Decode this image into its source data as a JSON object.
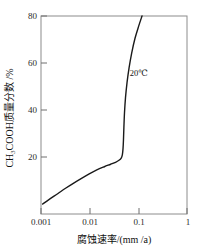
{
  "chart_data": {
    "type": "line",
    "title": "",
    "xlabel": "腐蚀速率/(mm /a)",
    "ylabel": "CH3COOH质量分数 /%",
    "ylabel_parts": {
      "prefix": "CH",
      "subscript": "3",
      "suffix": "COOH质量分数 /%"
    },
    "xscale": "log",
    "yscale": "linear",
    "xlim": [
      0.001,
      1
    ],
    "ylim": [
      0,
      80
    ],
    "xticks": [
      0.001,
      0.01,
      0.1,
      1
    ],
    "xticklabels": [
      "0.001",
      "0.01",
      "0.1",
      "1"
    ],
    "yticks": [
      20,
      40,
      60,
      80
    ],
    "yticklabels": [
      "20",
      "40",
      "60",
      "80"
    ],
    "grid": false,
    "legend": null,
    "annotations": [
      {
        "text": "20℃",
        "x": 0.055,
        "y": 57
      }
    ],
    "series": [
      {
        "name": "20℃",
        "color": "#1a1a1a",
        "points": [
          {
            "x": 0.00108,
            "y": 4.0
          },
          {
            "x": 0.0015,
            "y": 6.0
          },
          {
            "x": 0.0022,
            "y": 8.2
          },
          {
            "x": 0.0032,
            "y": 10.4
          },
          {
            "x": 0.0047,
            "y": 12.5
          },
          {
            "x": 0.0068,
            "y": 14.4
          },
          {
            "x": 0.0098,
            "y": 16.2
          },
          {
            "x": 0.014,
            "y": 17.8
          },
          {
            "x": 0.02,
            "y": 19.1
          },
          {
            "x": 0.027,
            "y": 20.1
          },
          {
            "x": 0.034,
            "y": 20.9
          },
          {
            "x": 0.04,
            "y": 21.7
          },
          {
            "x": 0.0445,
            "y": 22.6
          },
          {
            "x": 0.047,
            "y": 24.0
          },
          {
            "x": 0.0485,
            "y": 26.5
          },
          {
            "x": 0.0495,
            "y": 30.0
          },
          {
            "x": 0.0505,
            "y": 35.0
          },
          {
            "x": 0.052,
            "y": 41.0
          },
          {
            "x": 0.0545,
            "y": 47.0
          },
          {
            "x": 0.0585,
            "y": 53.0
          },
          {
            "x": 0.0645,
            "y": 59.0
          },
          {
            "x": 0.073,
            "y": 65.0
          },
          {
            "x": 0.0855,
            "y": 71.0
          },
          {
            "x": 0.102,
            "y": 76.0
          },
          {
            "x": 0.119,
            "y": 80.0
          }
        ]
      }
    ]
  },
  "style": {
    "frame_color": "#8c8c8c",
    "curve_color": "#1a1a1a",
    "background": "#ffffff",
    "text_color": "#1a1a1a"
  }
}
